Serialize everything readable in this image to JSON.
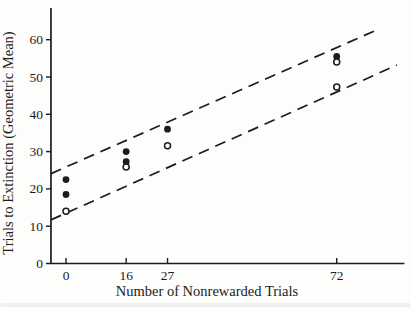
{
  "figure": {
    "background": "#fdfdfc",
    "ink_color": "#1c1c1c"
  },
  "chart_data": {
    "type": "scatter",
    "title": "",
    "xlabel": "Number of Nonrewarded Trials",
    "ylabel": "Trials to Extinction (Geometric Mean)",
    "xlim": [
      -4,
      90
    ],
    "ylim": [
      0,
      68.5
    ],
    "x_ticks": [
      0,
      16,
      27,
      72
    ],
    "y_ticks": [
      0,
      10,
      20,
      30,
      40,
      50,
      60
    ],
    "grid": false,
    "legend": "none",
    "series": [
      {
        "name": "filled-circle-group",
        "marker": "filled-circle",
        "points": [
          [
            0,
            22.5
          ],
          [
            0,
            18.5
          ],
          [
            16,
            30.0
          ],
          [
            16,
            27.3
          ],
          [
            27,
            36.0
          ],
          [
            72,
            55.5
          ]
        ]
      },
      {
        "name": "open-circle-group",
        "marker": "open-circle",
        "points": [
          [
            0,
            14.0
          ],
          [
            16,
            25.9
          ],
          [
            27,
            31.6
          ],
          [
            72,
            54.0
          ],
          [
            72,
            47.3
          ]
        ]
      }
    ],
    "reference_lines": [
      {
        "name": "upper-dashed-band-line",
        "style": "dashed",
        "from": [
          -4,
          24.1
        ],
        "to": [
          83.5,
          63.0
        ]
      },
      {
        "name": "lower-dashed-band-line",
        "style": "dashed",
        "from": [
          -4,
          11.7
        ],
        "to": [
          88.0,
          53.2
        ]
      }
    ]
  }
}
